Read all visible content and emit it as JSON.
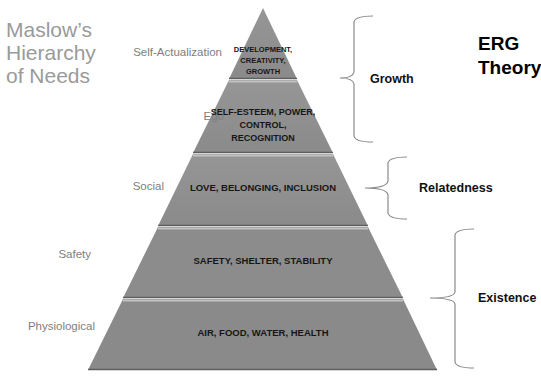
{
  "title": {
    "line1": "Maslow’s",
    "line2": "Hierarchy",
    "line3": "of Needs"
  },
  "erg_title": {
    "line1": "ERG",
    "line2": "Theory"
  },
  "colors": {
    "tier_fill_top": "#8f8f8f",
    "tier_fill_mid": "#959595",
    "tier_fill_bottom": "#888888",
    "tier_highlight": "#bdbdbd",
    "tier_shadow": "#5e5e5e",
    "level_label": "#7e7e7e",
    "title_text": "#9a9a9a",
    "brace": "#8a8a8a"
  },
  "pyramid": {
    "levels": [
      {
        "label": "Self-Actualization",
        "text_lines": [
          "DEVELOPMENT,",
          "CREATIVITY,",
          "GROWTH"
        ]
      },
      {
        "label": "Ego",
        "text_lines": [
          "SELF-ESTEEM, POWER,",
          "CONTROL,",
          "RECOGNITION"
        ]
      },
      {
        "label": "Social",
        "text_lines": [
          "LOVE, BELONGING, INCLUSION"
        ]
      },
      {
        "label": "Safety",
        "text_lines": [
          "SAFETY, SHELTER, STABILITY"
        ]
      },
      {
        "label": "Physiological",
        "text_lines": [
          "AIR, FOOD, WATER, HEALTH"
        ]
      }
    ]
  },
  "erg": {
    "groups": [
      {
        "label": "Growth",
        "spans_levels": [
          "Self-Actualization",
          "Ego"
        ]
      },
      {
        "label": "Relatedness",
        "spans_levels": [
          "Social"
        ]
      },
      {
        "label": "Existence",
        "spans_levels": [
          "Safety",
          "Physiological"
        ]
      }
    ]
  }
}
